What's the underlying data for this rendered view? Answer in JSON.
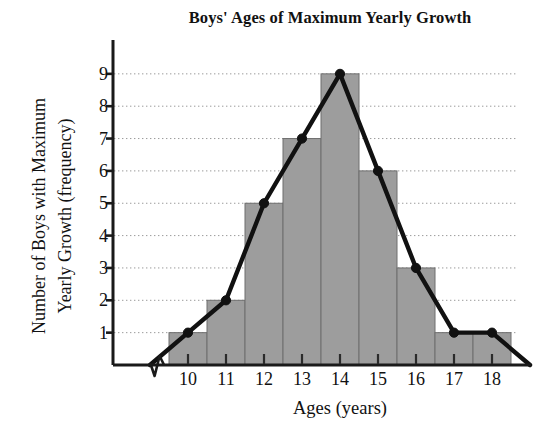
{
  "chart_data": {
    "type": "bar",
    "title": "Boys' Ages of Maximum Yearly Growth",
    "xlabel": "Ages (years)",
    "ylabel_line1": "Number of Boys with Maximum",
    "ylabel_line2": "Yearly Growth (frequency)",
    "ylabel": "Number of Boys with Maximum Yearly Growth (frequency)",
    "categories": [
      10,
      11,
      12,
      13,
      14,
      15,
      16,
      17,
      18
    ],
    "values": [
      1,
      2,
      5,
      7,
      9,
      6,
      3,
      1,
      1
    ],
    "x_tick_labels": [
      "10",
      "11",
      "12",
      "13",
      "14",
      "15",
      "16",
      "17",
      "18"
    ],
    "y_tick_labels": [
      "9",
      "8",
      "7",
      "6",
      "5",
      "4",
      "3",
      "2",
      "1"
    ],
    "y_ticks": [
      1,
      2,
      3,
      4,
      5,
      6,
      7,
      8,
      9
    ],
    "ylim": [
      0,
      9.6
    ],
    "xlim": [
      8.8,
      19.5
    ],
    "grid": "horizontal-dotted",
    "legend": "none",
    "overlay": {
      "type": "line",
      "name": "frequency polygon",
      "x": [
        9,
        10,
        11,
        12,
        13,
        14,
        15,
        16,
        17,
        18,
        19
      ],
      "values": [
        0,
        1,
        2,
        5,
        7,
        9,
        6,
        3,
        1,
        1,
        0
      ],
      "marker": "filled-circle",
      "markers_at": [
        10,
        11,
        12,
        13,
        14,
        15,
        16,
        17,
        18
      ]
    },
    "axis_break": {
      "axis": "x",
      "symbol": "zigzag",
      "position_years": 9.2
    },
    "colors": {
      "bar_fill": "#9d9d9d",
      "bar_edge": "#6e6e6e",
      "line": "#111111",
      "marker": "#111111",
      "grid": "#9a9a9a",
      "axis": "#1a1a1a",
      "text": "#111111",
      "background": "#ffffff"
    }
  }
}
